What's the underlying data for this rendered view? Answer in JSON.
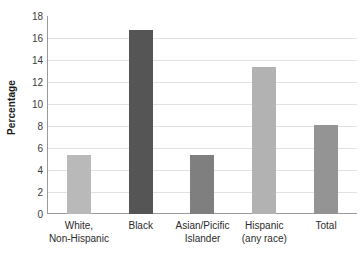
{
  "chart_data": {
    "type": "bar",
    "title": "",
    "subtitle": "",
    "xlabel": "",
    "ylabel": "Percentage",
    "categories": [
      "White, Non-Hispanic",
      "Black",
      "Asian/Picific Islander",
      "Hispanic (any race)",
      "Total"
    ],
    "category_lines": [
      [
        "White,",
        "Non-Hispanic"
      ],
      [
        "Black",
        ""
      ],
      [
        "Asian/Picific",
        "Islander"
      ],
      [
        "Hispanic",
        "(any race)"
      ],
      [
        "Total",
        ""
      ]
    ],
    "values": [
      5.4,
      16.7,
      5.4,
      13.4,
      8.1
    ],
    "bar_colors": [
      "#b9b9b9",
      "#555555",
      "#7f7f7f",
      "#b2b2b2",
      "#949494"
    ],
    "ylim": [
      0,
      18
    ],
    "ytick_step": 2,
    "ytick_labels": [
      "0",
      "2",
      "4",
      "6",
      "8",
      "10",
      "12",
      "14",
      "16",
      "18"
    ],
    "ytick_values": [
      0,
      2,
      4,
      6,
      8,
      10,
      12,
      14,
      16,
      18
    ],
    "grid": true,
    "grid_axis": "y",
    "grid_color": "#e2e2e2",
    "axis_color": "#9a9a9a",
    "legend": false,
    "legend_position": "none",
    "background_color": "#ffffff",
    "text_color": "#2b2b2b"
  }
}
